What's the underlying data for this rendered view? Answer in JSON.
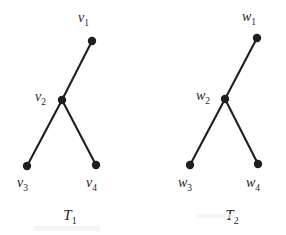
{
  "figure": {
    "name": "two-isomorphic-trees",
    "background_color": "#ffffff",
    "ink_color": "#1f1f1f",
    "node_radius": 4.2,
    "edge_width": 2.1
  },
  "trees": [
    {
      "id": "T1",
      "caption": "T",
      "caption_subscript": "1",
      "caption_x": 70,
      "caption_y": 208,
      "nodes": [
        {
          "id": "v1",
          "label": "v",
          "subscript": "1",
          "cx": 92,
          "cy": 41,
          "label_x": 78,
          "label_y": 11,
          "label_anchor": "left"
        },
        {
          "id": "v2",
          "label": "v",
          "subscript": "2",
          "cx": 62,
          "cy": 100,
          "label_x": 35,
          "label_y": 90,
          "label_anchor": "left"
        },
        {
          "id": "v3",
          "label": "v",
          "subscript": "3",
          "cx": 27,
          "cy": 166,
          "label_x": 17,
          "label_y": 176,
          "label_anchor": "left"
        },
        {
          "id": "v4",
          "label": "v",
          "subscript": "4",
          "cx": 96,
          "cy": 165,
          "label_x": 86,
          "label_y": 176,
          "label_anchor": "left"
        }
      ],
      "edges": [
        {
          "from": "v2",
          "to": "v1"
        },
        {
          "from": "v2",
          "to": "v3"
        },
        {
          "from": "v2",
          "to": "v4"
        }
      ]
    },
    {
      "id": "T2",
      "caption": "T",
      "caption_subscript": "2",
      "caption_x": 232,
      "caption_y": 208,
      "nodes": [
        {
          "id": "w1",
          "label": "w",
          "subscript": "1",
          "cx": 257,
          "cy": 38,
          "label_x": 242,
          "label_y": 10,
          "label_anchor": "left"
        },
        {
          "id": "w2",
          "label": "w",
          "subscript": "2",
          "cx": 225,
          "cy": 99,
          "label_x": 196,
          "label_y": 89,
          "label_anchor": "left"
        },
        {
          "id": "w3",
          "label": "w",
          "subscript": "3",
          "cx": 190,
          "cy": 165,
          "label_x": 178,
          "label_y": 176,
          "label_anchor": "left"
        },
        {
          "id": "w4",
          "label": "w",
          "subscript": "4",
          "cx": 258,
          "cy": 164,
          "label_x": 246,
          "label_y": 176,
          "label_anchor": "left"
        }
      ],
      "edges": [
        {
          "from": "w2",
          "to": "w1"
        },
        {
          "from": "w2",
          "to": "w3"
        },
        {
          "from": "w2",
          "to": "w4"
        }
      ]
    }
  ]
}
